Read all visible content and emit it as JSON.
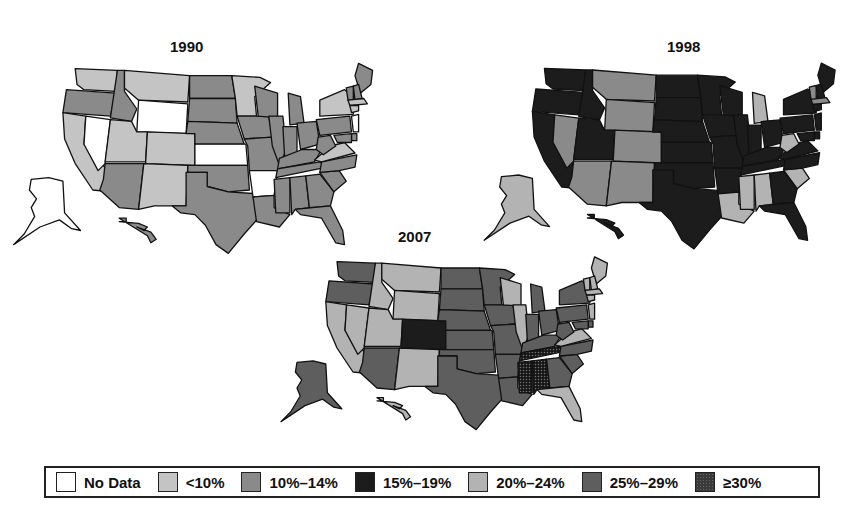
{
  "caption_partial": "(...) ... ... ... ...g... ...p...)",
  "legend": [
    {
      "key": "nodata",
      "label": "No Data",
      "color": "#ffffff"
    },
    {
      "key": "lt10",
      "label": "<10%",
      "color": "#c4c4c4"
    },
    {
      "key": "10_14",
      "label": "10%–14%",
      "color": "#8a8a8a"
    },
    {
      "key": "15_19",
      "label": "15%–19%",
      "color": "#1c1c1c"
    },
    {
      "key": "20_24",
      "label": "20%–24%",
      "color": "#b3b3b3"
    },
    {
      "key": "25_29",
      "label": "25%–29%",
      "color": "#5e5e5e"
    },
    {
      "key": "ge30",
      "label": "≥30%",
      "color": "#3a3a3a"
    }
  ],
  "maps": [
    {
      "year": "1990",
      "title": "1990"
    },
    {
      "year": "1998",
      "title": "1998"
    },
    {
      "year": "2007",
      "title": "2007"
    }
  ],
  "chart_data": {
    "type": "choropleth",
    "legend_title": "",
    "legend_position": "bottom",
    "categories": [
      "No Data",
      "<10%",
      "10%–14%",
      "15%–19%",
      "20%–24%",
      "25%–29%",
      "≥30%"
    ],
    "panels": [
      {
        "year": "1990",
        "states": {
          "WA": "<10%",
          "OR": "10%–14%",
          "CA": "<10%",
          "NV": "No Data",
          "ID": "10%–14%",
          "MT": "<10%",
          "WY": "No Data",
          "UT": "<10%",
          "CO": "<10%",
          "AZ": "10%–14%",
          "NM": "<10%",
          "ND": "10%–14%",
          "SD": "10%–14%",
          "NE": "10%–14%",
          "KS": "No Data",
          "OK": "10%–14%",
          "TX": "10%–14%",
          "MN": "<10%",
          "IA": "10%–14%",
          "MO": "10%–14%",
          "AR": "No Data",
          "LA": "10%–14%",
          "WI": "10%–14%",
          "IL": "10%–14%",
          "MI": "10%–14%",
          "IN": "10%–14%",
          "OH": "10%–14%",
          "KY": "10%–14%",
          "TN": "10%–14%",
          "MS": "10%–14%",
          "AL": "10%–14%",
          "GA": "10%–14%",
          "FL": "10%–14%",
          "SC": "10%–14%",
          "NC": "10%–14%",
          "VA": "<10%",
          "WV": "10%–14%",
          "PA": "10%–14%",
          "NY": "<10%",
          "ME": "10%–14%",
          "VT": "10%–14%",
          "NH": "10%–14%",
          "MA": "<10%",
          "CT": "<10%",
          "NJ": "No Data",
          "DE": "10%–14%",
          "MD": "10%–14%",
          "AK": "No Data",
          "HI": "10%–14%"
        }
      },
      {
        "year": "1998",
        "states": {
          "WA": "15%–19%",
          "OR": "15%–19%",
          "CA": "15%–19%",
          "NV": "10%–14%",
          "ID": "15%–19%",
          "MT": "10%–14%",
          "WY": "10%–14%",
          "UT": "15%–19%",
          "CO": "10%–14%",
          "AZ": "10%–14%",
          "NM": "10%–14%",
          "ND": "15%–19%",
          "SD": "15%–19%",
          "NE": "15%–19%",
          "KS": "15%–19%",
          "OK": "15%–19%",
          "TX": "15%–19%",
          "MN": "15%–19%",
          "IA": "15%–19%",
          "MO": "15%–19%",
          "AR": "15%–19%",
          "LA": "20%–24%",
          "WI": "15%–19%",
          "IL": "15%–19%",
          "MI": "20%–24%",
          "IN": "15%–19%",
          "OH": "15%–19%",
          "KY": "15%–19%",
          "TN": "15%–19%",
          "MS": "20%–24%",
          "AL": "20%–24%",
          "GA": "15%–19%",
          "FL": "15%–19%",
          "SC": "20%–24%",
          "NC": "15%–19%",
          "VA": "15%–19%",
          "WV": "20%–24%",
          "PA": "15%–19%",
          "NY": "15%–19%",
          "ME": "15%–19%",
          "VT": "10%–14%",
          "NH": "15%–19%",
          "MA": "10%–14%",
          "CT": "15%–19%",
          "NJ": "15%–19%",
          "DE": "15%–19%",
          "MD": "15%–19%",
          "AK": "20%–24%",
          "HI": "15%–19%"
        }
      },
      {
        "year": "2007",
        "states": {
          "WA": "25%–29%",
          "OR": "25%–29%",
          "CA": "20%–24%",
          "NV": "20%–24%",
          "ID": "20%–24%",
          "MT": "20%–24%",
          "WY": "20%–24%",
          "UT": "20%–24%",
          "CO": "15%–19%",
          "AZ": "25%–29%",
          "NM": "20%–24%",
          "ND": "25%–29%",
          "SD": "25%–29%",
          "NE": "25%–29%",
          "KS": "25%–29%",
          "OK": "25%–29%",
          "TX": "25%–29%",
          "MN": "25%–29%",
          "IA": "25%–29%",
          "MO": "25%–29%",
          "AR": "25%–29%",
          "LA": "25%–29%",
          "WI": "20%–24%",
          "IL": "20%–24%",
          "MI": "25%–29%",
          "IN": "25%–29%",
          "OH": "25%–29%",
          "KY": "25%–29%",
          "TN": "≥30%",
          "MS": "≥30%",
          "AL": "≥30%",
          "GA": "25%–29%",
          "FL": "20%–24%",
          "SC": "25%–29%",
          "NC": "25%–29%",
          "VA": "20%–24%",
          "WV": "25%–29%",
          "PA": "25%–29%",
          "NY": "25%–29%",
          "ME": "20%–24%",
          "VT": "20%–24%",
          "NH": "20%–24%",
          "MA": "20%–24%",
          "CT": "20%–24%",
          "NJ": "20%–24%",
          "DE": "25%–29%",
          "MD": "25%–29%",
          "AK": "25%–29%",
          "HI": "20%–24%"
        }
      }
    ]
  }
}
